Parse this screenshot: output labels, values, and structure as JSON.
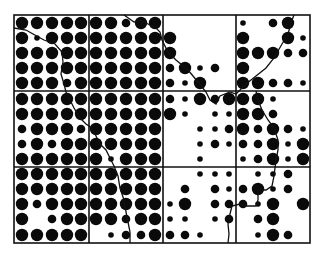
{
  "diagram": {
    "type": "proportional-dot-grid-map",
    "frame": {
      "left": 14,
      "top": 15,
      "right": 310,
      "bottom": 243
    },
    "col_lines": [
      89,
      163,
      236
    ],
    "row_lines": [
      91,
      167
    ],
    "dot_x": [
      22,
      37,
      52,
      67,
      81,
      96,
      111,
      126,
      141,
      155,
      170,
      185,
      200,
      215,
      229,
      243,
      258,
      273,
      288,
      303
    ],
    "dot_y": [
      23,
      38,
      53,
      68,
      83,
      99,
      114,
      129,
      144,
      159,
      174,
      189,
      204,
      219,
      235
    ],
    "radius": {
      "L": 6.2,
      "M": 4.3,
      "S": 2.8
    },
    "rows": [
      "LLLLLLLMLL00000S0ML",
      "LSLLLLLLLLL0000L00LS",
      "LLLLLLLLLLL0000LLLMM",
      "LLLLLLLLLLMLSM0L0000",
      "LLLMLLLLLLMSL00LLMMS",
      "LLLLLLLLLLMSLMLLLS00",
      "LLLLLLLLLLLS0SSLLM00",
      "MLLLMLLLLL00SSMLMLMS",
      "MLMLLLLLLL00SMSMMLSL",
      "LLLLLLSLLL00S00SMLSL",
      "LLLLLLLLLL00SSS0SSM0",
      "LLLLLLLLLL0M0MSMLSM0",
      "LMLLLLLLLLSL0MMMSL0L",
      "L0MLLLLMLLSS0SM0ML00",
      "LLLLL0SMMLMMS000SLM0"
    ],
    "boundary_path": "M 14 28 L 26 30 L 33 34 L 44 40 L 55 44 L 62 52 L 63 62 L 61 74 L 64 84 L 66 92 L 70 100 L 74 108 L 80 118 L 86 124 L 92 128 L 96 136 L 100 144 L 106 150 L 110 158 L 114 166 L 118 176 L 120 188 L 124 200 L 126 212 L 128 222 L 130 232 L 130 243",
    "coast_path": "M 124 15 L 134 22 L 140 20 L 148 24 L 156 28 L 160 32 L 162 40 L 168 52 L 176 60 L 188 70 L 198 82 L 206 92 L 210 100 L 216 104 L 220 96 L 230 92 L 236 94 L 246 84 L 256 76 L 266 68 L 274 58 L 282 44 L 288 34 L 292 20 L 294 15",
    "coast_path2": "M 256 91 L 258 100 L 262 110 L 268 120 L 274 128 L 278 140 L 278 150 L 276 160 L 275 168 L 274 176 L 272 186 L 266 190 L 258 190 L 258 200 L 256 206 L 246 206 L 240 204 L 232 206 L 230 214 L 228 224 L 229 234 L 228 243"
  }
}
